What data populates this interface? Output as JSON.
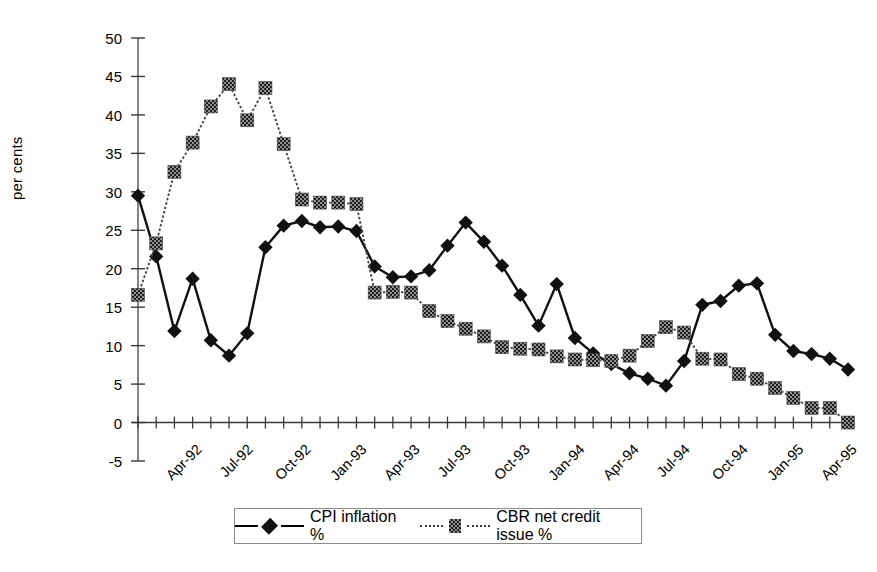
{
  "chart_data": {
    "type": "line",
    "title": "",
    "xlabel": "",
    "ylabel": "per cents",
    "ylim": [
      -5,
      50
    ],
    "ytick_step": 5,
    "yticks": [
      50,
      45,
      40,
      35,
      30,
      25,
      20,
      15,
      10,
      5,
      0,
      -5
    ],
    "grid": false,
    "legend_position": "bottom",
    "x": [
      "Apr-92",
      "May-92",
      "Jun-92",
      "Jul-92",
      "Aug-92",
      "Sep-92",
      "Oct-92",
      "Nov-92",
      "Dec-92",
      "Jan-93",
      "Feb-93",
      "Mar-93",
      "Apr-93",
      "May-93",
      "Jun-93",
      "Jul-93",
      "Aug-93",
      "Sep-93",
      "Oct-93",
      "Nov-93",
      "Dec-93",
      "Jan-94",
      "Feb-94",
      "Mar-94",
      "Apr-94",
      "May-94",
      "Jun-94",
      "Jul-94",
      "Aug-94",
      "Sep-94",
      "Oct-94",
      "Nov-94",
      "Dec-94",
      "Jan-95",
      "Feb-95",
      "Mar-95",
      "Apr-95",
      "May-95",
      "Jun-95",
      "Jul-95"
    ],
    "xtick_labels": [
      "Apr-92",
      "Jul-92",
      "Oct-92",
      "Jan-93",
      "Apr-93",
      "Jul-93",
      "Oct-93",
      "Jan-94",
      "Apr-94",
      "Jul-94",
      "Oct-94",
      "Jan-95",
      "Apr-95"
    ],
    "xtick_indices": [
      0,
      3,
      6,
      9,
      12,
      15,
      18,
      21,
      24,
      27,
      30,
      33,
      36
    ],
    "series": [
      {
        "name": "CPI inflation %",
        "marker": "diamond",
        "color": "#111111",
        "values": [
          29.5,
          21.6,
          11.9,
          18.7,
          10.7,
          8.7,
          11.6,
          22.8,
          25.6,
          26.2,
          25.4,
          25.5,
          24.9,
          20.3,
          18.9,
          19.0,
          19.8,
          23.0,
          26.0,
          23.5,
          20.4,
          16.6,
          12.6,
          18.0,
          11.0,
          9.0,
          7.6,
          6.4,
          5.7,
          4.8,
          8.0,
          15.3,
          15.8,
          17.8,
          18.1,
          11.4,
          9.3,
          8.9,
          8.3,
          6.9
        ]
      },
      {
        "name": "CBR net credit issue %",
        "marker": "square",
        "color": "#555555",
        "values": [
          16.6,
          23.3,
          32.6,
          36.4,
          41.1,
          44.0,
          39.3,
          43.5,
          36.2,
          29.0,
          28.6,
          28.6,
          28.4,
          16.9,
          17.0,
          16.9,
          14.5,
          13.2,
          12.2,
          11.2,
          9.8,
          9.6,
          9.5,
          8.6,
          8.2,
          8.1,
          8.0,
          8.7,
          10.6,
          12.4,
          11.7,
          8.3,
          8.2,
          6.3,
          5.7,
          4.5,
          3.2,
          1.9,
          1.9,
          0.0
        ]
      }
    ]
  },
  "legend": {
    "items": [
      {
        "label": "CPI inflation %"
      },
      {
        "label": "CBR net credit issue %"
      }
    ]
  }
}
